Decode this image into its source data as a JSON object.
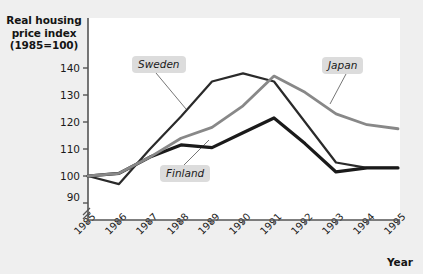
{
  "chart_data": {
    "type": "line",
    "title": "",
    "ylabel": "Real housing price index (1985=100)",
    "xlabel": "Year",
    "categories": [
      "1985",
      "1986",
      "1987",
      "1988",
      "1989",
      "1990",
      "1991",
      "1992",
      "1993",
      "1994",
      "1995"
    ],
    "x": [
      1985,
      1986,
      1987,
      1988,
      1989,
      1990,
      1991,
      1992,
      1993,
      1994,
      1995
    ],
    "ylim": [
      86,
      144
    ],
    "yticks": [
      90,
      100,
      110,
      120,
      130,
      140
    ],
    "axis_break": true,
    "grid": false,
    "legend_position": "inline-annotations",
    "series": [
      {
        "name": "Sweden",
        "color": "#2a2a2a",
        "width": 2.2,
        "values": [
          100,
          97,
          110,
          122,
          135,
          138,
          135,
          120,
          105,
          103,
          103
        ]
      },
      {
        "name": "Finland",
        "color": "#1a1a1a",
        "width": 3.2,
        "values": [
          100,
          101,
          107,
          111.5,
          110.5,
          116,
          121.5,
          112,
          101.5,
          103,
          103
        ]
      },
      {
        "name": "Japan",
        "color": "#888888",
        "width": 2.8,
        "values": [
          100,
          101,
          107,
          114,
          118,
          126,
          137,
          131,
          123,
          119,
          117.5
        ]
      }
    ],
    "annotations": [
      {
        "label": "Sweden",
        "box_x": 132,
        "box_y": 56,
        "leader_to_x": 186,
        "leader_to_y": 109
      },
      {
        "label": "Finland",
        "box_x": 160,
        "box_y": 165,
        "leader_to_x": 209,
        "leader_to_y": 140
      },
      {
        "label": "Japan",
        "box_x": 322,
        "box_y": 57,
        "leader_to_x": 330,
        "leader_to_y": 104
      }
    ]
  },
  "yticks": {
    "t140": "140",
    "t130": "130",
    "t120": "120",
    "t110": "110",
    "t100": "100",
    "t90": "90"
  },
  "xticks": {
    "y1985": "1985",
    "y1986": "1986",
    "y1987": "1987",
    "y1988": "1988",
    "y1989": "1989",
    "y1990": "1990",
    "y1991": "1991",
    "y1992": "1992",
    "y1993": "1993",
    "y1994": "1994",
    "y1995": "1995"
  },
  "labels": {
    "y_axis_title": "Real housing\nprice index\n(1985=100)",
    "y_axis_title_line1": "Real housing",
    "y_axis_title_line2": "price index",
    "y_axis_title_line3": "(1985=100)",
    "x_axis_title": "Year",
    "sweden": "Sweden",
    "finland": "Finland",
    "japan": "Japan"
  },
  "colors": {
    "background": "#efefef",
    "plot_background": "#ffffff",
    "axis": "#555555",
    "sweden_line": "#2a2a2a",
    "finland_line": "#1a1a1a",
    "japan_line": "#888888",
    "label_box": "#dcdcdc"
  }
}
